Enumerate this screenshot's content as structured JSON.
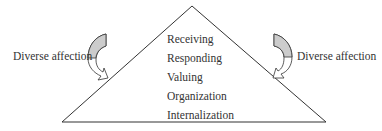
{
  "diagram": {
    "type": "pyramid",
    "levels": [
      "Receiving",
      "Responding",
      "Valuing",
      "Organization",
      "Internalization"
    ],
    "left_label": "Diverse affection",
    "right_label": "Diverse affection",
    "colors": {
      "line": "#333333",
      "arrow_fill": "#cccccc",
      "text": "#333333"
    }
  }
}
